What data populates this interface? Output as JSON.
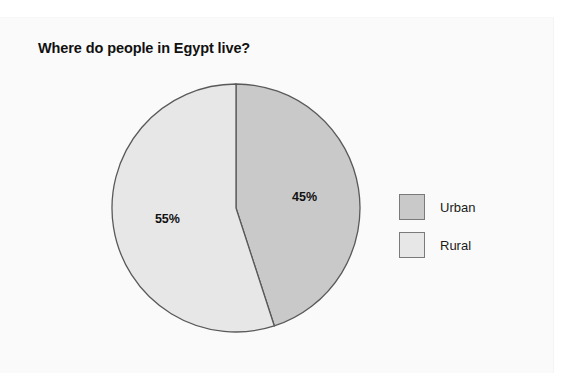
{
  "chart_data": {
    "type": "pie",
    "title": "Where do people in Egypt live?",
    "categories": [
      "Urban",
      "Rural"
    ],
    "values": [
      45,
      55
    ],
    "value_labels": [
      "45%",
      "55%"
    ],
    "colors": [
      "#c9c9c9",
      "#e7e7e7"
    ],
    "slice_border_color": "#595959",
    "start_angle_deg": 0,
    "direction": "clockwise",
    "legend_position": "right",
    "grid": false,
    "xlabel": "",
    "ylabel": ""
  },
  "chart": {
    "title": "Where do people in Egypt live?",
    "slices": [
      {
        "name": "Urban",
        "label": "45%",
        "percent": 45,
        "color": "#c9c9c9"
      },
      {
        "name": "Rural",
        "label": "55%",
        "percent": 55,
        "color": "#e7e7e7"
      }
    ]
  },
  "legend": {
    "items": [
      {
        "label": "Urban",
        "color": "#c9c9c9"
      },
      {
        "label": "Rural",
        "color": "#e7e7e7"
      }
    ]
  },
  "geometry": {
    "center_x": 126,
    "center_y": 126,
    "radius": 124
  }
}
